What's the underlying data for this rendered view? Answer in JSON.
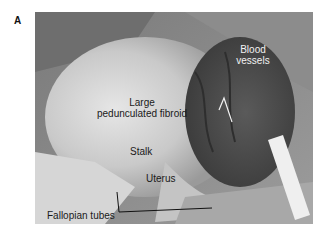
{
  "figure": {
    "panel_letter": "A",
    "labels": {
      "fibroid_line1": "Large",
      "fibroid_line2": "pedunculated fibroid",
      "vessels_line1": "Blood",
      "vessels_line2": "vessels",
      "stalk": "Stalk",
      "uterus": "Uterus",
      "tubes": "Fallopian tubes"
    },
    "colors": {
      "background": "#ffffff",
      "label_dark": "#1a1a1a",
      "label_light": "#f2f2f2"
    }
  }
}
